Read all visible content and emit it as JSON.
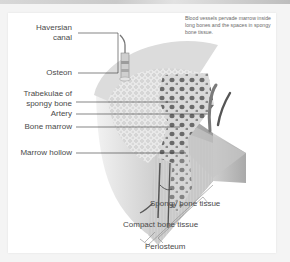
{
  "figure": {
    "caption": "Blood vessels pervade marrow inside long bones and the spaces in spongy bone tissue.",
    "labels_left": [
      {
        "id": "haversian",
        "text": "Haversian canal",
        "line1": "Haversian",
        "line2": "canal"
      },
      {
        "id": "osteon",
        "text": "Osteon"
      },
      {
        "id": "trabeculae",
        "text": "Trabekulae of spongy bone",
        "line1": "Trabekulae of",
        "line2": "spongy bone"
      },
      {
        "id": "artery",
        "text": "Artery"
      },
      {
        "id": "bone-marrow",
        "text": "Bone marrow"
      },
      {
        "id": "marrow-hollow",
        "text": "Marrow hollow"
      }
    ],
    "labels_bottom": [
      {
        "id": "spongy-bone-tissue",
        "text": "Spongy bone tissue"
      },
      {
        "id": "compact-bone-tissue",
        "text": "Compact bone tissue"
      },
      {
        "id": "periosteum",
        "text": "Periosteum"
      }
    ],
    "colors": {
      "bone_light": "#eeeeee",
      "bone_mid": "#bdbdbd",
      "bone_dark": "#7a7a7a",
      "vessel": "#6d6d6d",
      "leader_line": "#333333"
    }
  }
}
